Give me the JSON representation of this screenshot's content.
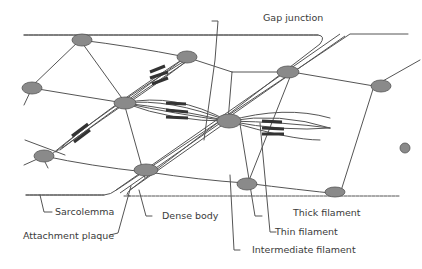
{
  "diagram": {
    "colors": {
      "line": "#555555",
      "node_fill": "#8a8a8a",
      "thick_filament": "#333333",
      "text": "#3a3a3a"
    },
    "labels": {
      "gap_junction": "Gap junction",
      "sarcolemma": "Sarcolemma",
      "dense_body": "Dense body",
      "attachment_plaque": "Attachment plaque",
      "thick_filament": "Thick filament",
      "thin_filament": "Thin filament",
      "intermediate_filament": "Intermediate filament"
    }
  }
}
